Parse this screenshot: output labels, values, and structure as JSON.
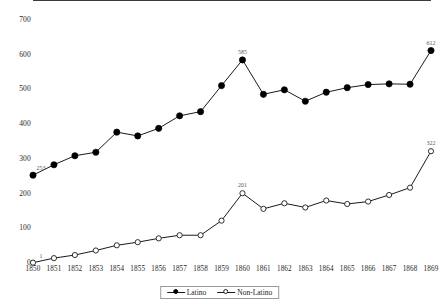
{
  "chart_data": {
    "type": "line",
    "title": "",
    "subtitle": "",
    "xlabel": "",
    "ylabel": "",
    "grid": false,
    "legend_position": "bottom-center",
    "ylim": [
      0,
      700
    ],
    "ytick_labels": [
      "0",
      "100",
      "200",
      "300",
      "400",
      "500",
      "600",
      "700"
    ],
    "ytick_values": [
      0,
      100,
      200,
      300,
      400,
      500,
      600,
      700
    ],
    "categories": [
      "1850",
      "1851",
      "1852",
      "1853",
      "1854",
      "1855",
      "1856",
      "1857",
      "1858",
      "1859",
      "1860",
      "1861",
      "1862",
      "1863",
      "1864",
      "1865",
      "1866",
      "1867",
      "1868",
      "1869"
    ],
    "series": [
      {
        "name": "Latino",
        "marker": "filled-circle",
        "color": "#000000",
        "values": [
          253,
          283,
          309,
          319,
          377,
          366,
          388,
          424,
          436,
          511,
          585,
          486,
          499,
          466,
          492,
          505,
          514,
          516,
          515,
          612
        ],
        "point_labels": {
          "0": "253",
          "10": "585",
          "19": "612"
        }
      },
      {
        "name": "Non-Latino",
        "marker": "open-circle",
        "color": "#000000",
        "values": [
          1,
          14,
          23,
          36,
          51,
          60,
          71,
          80,
          80,
          122,
          201,
          156,
          172,
          160,
          180,
          170,
          177,
          196,
          217,
          322
        ],
        "point_labels": {
          "0": "1",
          "10": "201",
          "19": "322"
        }
      }
    ],
    "legend": [
      {
        "label": "Latino",
        "marker": "filled-circle"
      },
      {
        "label": "Non-Latino",
        "marker": "open-circle"
      }
    ]
  }
}
